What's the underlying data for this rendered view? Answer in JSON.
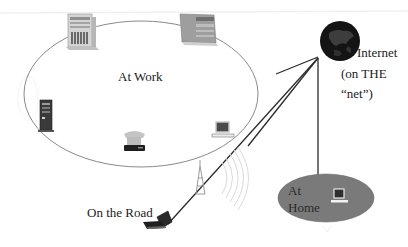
{
  "diagram": {
    "colors": {
      "background": "#ffffff",
      "work_ellipse_stroke": "#8a8a8a",
      "link_line": "#2b2b2b",
      "home_ellipse_fill": "#7a7a7a",
      "globe_fill": "#141414",
      "device_light": "#c9c9c9",
      "device_dark": "#3a3a3a"
    },
    "zones": {
      "work": {
        "label": "At Work"
      },
      "internet": {
        "label_line1": "Internet",
        "label_line2": "(on THE",
        "label_line3": "“net”)"
      },
      "road": {
        "label": "On the Road"
      },
      "home": {
        "label_line1": "At",
        "label_line2": "Home"
      }
    },
    "nodes": [
      {
        "id": "work-tower-server",
        "icon": "tower-server-icon",
        "zone": "work"
      },
      {
        "id": "work-rack-server",
        "icon": "rack-server-icon",
        "zone": "work"
      },
      {
        "id": "work-dark-tower",
        "icon": "dark-tower-server-icon",
        "zone": "work"
      },
      {
        "id": "work-telephone",
        "icon": "telephone-icon",
        "zone": "work"
      },
      {
        "id": "work-desktop",
        "icon": "desktop-computer-icon",
        "zone": "work"
      },
      {
        "id": "internet-globe",
        "icon": "globe-icon",
        "zone": "internet"
      },
      {
        "id": "cell-tower",
        "icon": "antenna-tower-icon",
        "zone": "road"
      },
      {
        "id": "road-laptop",
        "icon": "laptop-icon",
        "zone": "road"
      },
      {
        "id": "home-computer",
        "icon": "desktop-computer-icon",
        "zone": "home"
      }
    ],
    "links": [
      {
        "from": "internet-globe",
        "to": "work"
      },
      {
        "from": "internet-globe",
        "to": "work-lower"
      },
      {
        "from": "internet-globe",
        "to": "road-laptop"
      },
      {
        "from": "internet-globe",
        "to": "home"
      }
    ]
  }
}
